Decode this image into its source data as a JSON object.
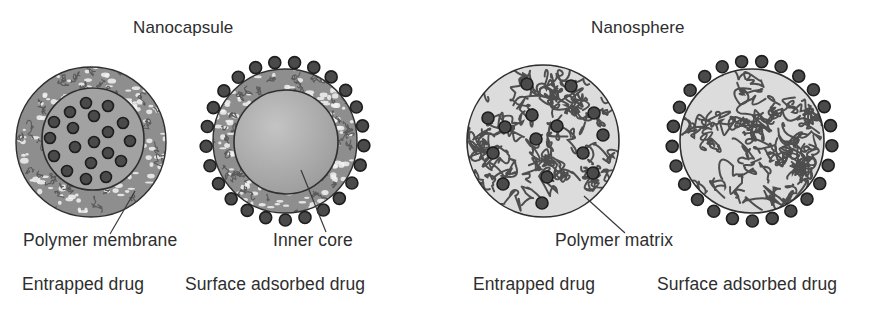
{
  "colors": {
    "background": "#ffffff",
    "text": "#2e2e2e",
    "outline": "#2f2f2f",
    "shell_fill": "#8e8e8e",
    "shell_fleck": "#f2f2f2",
    "shell_squiggle": "#5a5a5a",
    "core_fill_light": "#c4c4c4",
    "core_fill_dark": "#9c9c9c",
    "capsule1_core": "#a2a2a2",
    "matrix_fill": "#dcdcdc",
    "matrix_squiggle": "#4e4e4e",
    "drug_fill": "#4a4a4a",
    "drug_rim": "#1e1e1e",
    "leader": "#3a3a3a"
  },
  "titles": [
    {
      "id": "nanocapsule",
      "text": "Nanocapsule",
      "x": 133,
      "y": 19
    },
    {
      "id": "nanosphere",
      "text": "Nanosphere",
      "x": 591,
      "y": 19
    }
  ],
  "labels": [
    {
      "id": "polymer-membrane",
      "text": "Polymer membrane",
      "x": 23,
      "y": 232
    },
    {
      "id": "inner-core",
      "text": "Inner core",
      "x": 273,
      "y": 232
    },
    {
      "id": "polymer-matrix",
      "text": "Polymer matrix",
      "x": 555,
      "y": 232
    },
    {
      "id": "nanocapsule-entrapped",
      "text": "Entrapped drug",
      "x": 22,
      "y": 276
    },
    {
      "id": "nanocapsule-surface",
      "text": "Surface adsorbed drug",
      "x": 185,
      "y": 276
    },
    {
      "id": "nanosphere-entrapped",
      "text": "Entrapped drug",
      "x": 473,
      "y": 276
    },
    {
      "id": "nanosphere-surface",
      "text": "Surface adsorbed drug",
      "x": 657,
      "y": 276
    }
  ],
  "leaders": [
    {
      "id": "leader-polymer-membrane",
      "x1": 135,
      "y1": 191,
      "x2": 110,
      "y2": 234
    },
    {
      "id": "leader-inner-core",
      "x1": 301,
      "y1": 170,
      "x2": 326,
      "y2": 232
    },
    {
      "id": "leader-polymer-matrix",
      "x1": 584,
      "y1": 196,
      "x2": 625,
      "y2": 233
    }
  ],
  "particles": [
    {
      "id": "nanocapsule-entrapped",
      "type": "nanocapsule",
      "cx": 91,
      "cy": 142,
      "r": 75,
      "core": {
        "cx": 93,
        "cy": 139,
        "r": 51
      },
      "drug_radius": 5.5,
      "internal_drugs": [
        [
          86,
          103
        ],
        [
          108,
          106
        ],
        [
          70,
          112
        ],
        [
          94,
          116
        ],
        [
          54,
          122
        ],
        [
          123,
          123
        ],
        [
          73,
          128
        ],
        [
          108,
          132
        ],
        [
          50,
          138
        ],
        [
          130,
          141
        ],
        [
          94,
          142
        ],
        [
          75,
          147
        ],
        [
          108,
          153
        ],
        [
          54,
          156
        ],
        [
          91,
          163
        ],
        [
          121,
          161
        ],
        [
          67,
          171
        ],
        [
          86,
          179
        ],
        [
          106,
          177
        ]
      ]
    },
    {
      "id": "nanocapsule-surface",
      "type": "nanocapsule",
      "cx": 285,
      "cy": 141,
      "r": 72,
      "core": {
        "cx": 286,
        "cy": 142,
        "r": 52
      },
      "drug_radius": 6,
      "surface_ring_radius": 79,
      "surface_drug_count": 25
    },
    {
      "id": "nanosphere-entrapped",
      "type": "nanosphere",
      "cx": 543,
      "cy": 141,
      "r": 76,
      "drug_radius": 6,
      "internal_drugs": [
        [
          527,
          84
        ],
        [
          571,
          86
        ],
        [
          488,
          118
        ],
        [
          532,
          115
        ],
        [
          594,
          113
        ],
        [
          505,
          127
        ],
        [
          557,
          126
        ],
        [
          603,
          135
        ],
        [
          536,
          139
        ],
        [
          493,
          153
        ],
        [
          583,
          153
        ],
        [
          593,
          173
        ],
        [
          503,
          184
        ],
        [
          547,
          177
        ],
        [
          542,
          203
        ]
      ]
    },
    {
      "id": "nanosphere-surface",
      "type": "nanosphere",
      "cx": 752,
      "cy": 141,
      "r": 72,
      "drug_radius": 6,
      "surface_ring_radius": 80,
      "surface_drug_count": 25
    }
  ]
}
